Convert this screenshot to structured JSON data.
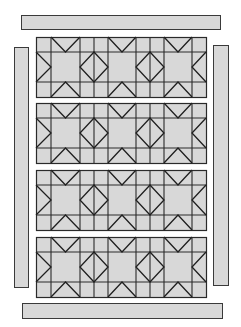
{
  "diagram": {
    "type": "quilt-layout",
    "canvas": {
      "width": 241,
      "height": 327,
      "background": "#ffffff"
    },
    "colors": {
      "fabric": "#d8d8d8",
      "line": "#2a2a2a",
      "border_line": "#3a3a3a"
    },
    "borders": [
      {
        "name": "top-border",
        "x": 21,
        "y": 15,
        "w": 199,
        "h": 14
      },
      {
        "name": "bottom-border",
        "x": 22,
        "y": 303,
        "w": 200,
        "h": 15
      },
      {
        "name": "left-border",
        "x": 14,
        "y": 47,
        "w": 14,
        "h": 240
      },
      {
        "name": "right-border",
        "x": 213,
        "y": 45,
        "w": 15,
        "h": 240
      }
    ],
    "rows": [
      {
        "name": "block-row-1",
        "y": 37
      },
      {
        "name": "block-row-2",
        "y": 103
      },
      {
        "name": "block-row-3",
        "y": 170
      },
      {
        "name": "block-row-4",
        "y": 237
      }
    ],
    "row_geometry": {
      "x": 36,
      "width": 170,
      "height": 60,
      "h_lines": [
        15,
        45
      ],
      "v_lines": [
        15,
        44,
        58,
        72,
        100,
        114,
        128,
        156
      ],
      "star_centers": [
        {
          "x0": 15,
          "x1": 44
        },
        {
          "x0": 72,
          "x1": 100
        },
        {
          "x0": 128,
          "x1": 156
        }
      ],
      "diamonds": [
        {
          "cx": 58,
          "half": 14
        },
        {
          "cx": 114,
          "half": 14
        }
      ],
      "edge_points": {
        "left_strip": 15,
        "right_strip": 156
      }
    }
  }
}
